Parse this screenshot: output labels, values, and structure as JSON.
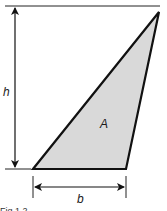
{
  "diagram": {
    "type": "triangle-area-dimensions",
    "labels": {
      "height": "h",
      "area": "A",
      "base": "b"
    },
    "caption": "Fig 1.2",
    "colors": {
      "fill": "#d9d9d9",
      "stroke": "#111111",
      "background": "#ffffff"
    }
  }
}
